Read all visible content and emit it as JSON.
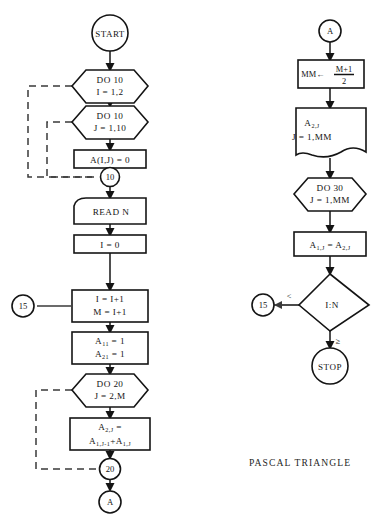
{
  "diagram": {
    "caption": "PASCAL  TRIANGLE",
    "colors": {
      "stroke": "#141414",
      "loop_stroke": "#3a3a3a",
      "background": "#ffffff"
    }
  },
  "left_column": {
    "start": {
      "label": "START"
    },
    "do10_outer": {
      "line1": "DO  10",
      "line2": "I = 1,2"
    },
    "do10_inner": {
      "line1": "DO  10",
      "line2": "J = 1,10"
    },
    "zero_fill": {
      "label": "A(I,J) = 0"
    },
    "conn_10": {
      "label": "10"
    },
    "read": {
      "label": "READ  N"
    },
    "init_i": {
      "label": "I = 0"
    },
    "increment": {
      "line1": "I = I+1",
      "line2": "M = I+1"
    },
    "conn_15": {
      "label": "15"
    },
    "seed": {
      "line1_base": "A",
      "line1_sub": "11",
      "line1_rest": " = 1",
      "line2_base": "A",
      "line2_sub": "21",
      "line2_rest": " = 1"
    },
    "do20": {
      "line1": "DO  20",
      "line2": "J = 2,M"
    },
    "sum": {
      "line1_base": "A",
      "line1_sub": "2,J",
      "line1_rest": " =",
      "line2_base1": "A",
      "line2_sub1": "1,J-1",
      "line2_plus": "+",
      "line2_base2": "A",
      "line2_sub2": "1,J"
    },
    "conn_20": {
      "label": "20"
    },
    "conn_a_out": {
      "label": "A"
    }
  },
  "right_column": {
    "conn_a_in": {
      "label": "A"
    },
    "midpoint": {
      "lhs": "MM",
      "arrow": "←",
      "numerator": "M+1",
      "denominator": "2"
    },
    "output": {
      "line1_base": "A",
      "line1_sub": "2,J",
      "line2": "J = 1,MM"
    },
    "do30": {
      "line1": "DO  30",
      "line2": "J = 1,MM"
    },
    "copy": {
      "lhs_base": "A",
      "lhs_sub": "1,J",
      "eq": " = ",
      "rhs_base": "A",
      "rhs_sub": "2,J"
    },
    "decision": {
      "label": "I:N"
    },
    "branch_less": {
      "label": "<"
    },
    "branch_ge": {
      "label": "≥"
    },
    "conn_15_target": {
      "label": "15"
    },
    "stop": {
      "label": "STOP"
    }
  }
}
